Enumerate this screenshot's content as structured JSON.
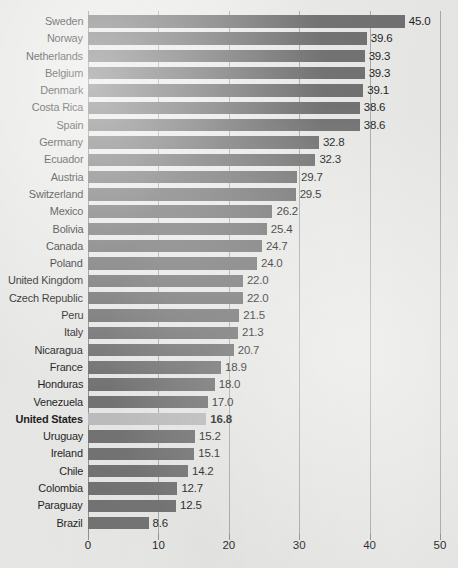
{
  "chart_data": {
    "type": "bar",
    "orientation": "horizontal",
    "title": "",
    "subtitle": "",
    "xlabel": "",
    "ylabel": "",
    "xlim": [
      0,
      50
    ],
    "xticks": [
      0,
      10,
      20,
      30,
      40,
      50
    ],
    "xtick_labels": [
      "0",
      "10",
      "20",
      "30",
      "40",
      "50"
    ],
    "grid": true,
    "grid_axis": "x",
    "legend": false,
    "value_labels": true,
    "value_label_format": "one-decimal",
    "highlight_category": "United States",
    "colors": {
      "bar": "#6f6f6f",
      "bar_highlight": "#bcbcbc",
      "background": "#e9e9e7",
      "gridline": "#a9a9a9",
      "axis": "#8e8e8e",
      "text": "#1b1b1b"
    },
    "categories": [
      "Sweden",
      "Norway",
      "Netherlands",
      "Belgium",
      "Denmark",
      "Costa Rica",
      "Spain",
      "Germany",
      "Ecuador",
      "Austria",
      "Switzerland",
      "Mexico",
      "Bolivia",
      "Canada",
      "Poland",
      "United Kingdom",
      "Czech Republic",
      "Peru",
      "Italy",
      "Nicaragua",
      "France",
      "Honduras",
      "Venezuela",
      "United States",
      "Uruguay",
      "Ireland",
      "Chile",
      "Colombia",
      "Paraguay",
      "Brazil"
    ],
    "values": [
      45.0,
      39.6,
      39.3,
      39.3,
      39.1,
      38.6,
      38.6,
      32.8,
      32.3,
      29.7,
      29.5,
      26.2,
      25.4,
      24.7,
      24.0,
      22.0,
      22.0,
      21.5,
      21.3,
      20.7,
      18.9,
      18.0,
      17.0,
      16.8,
      15.2,
      15.1,
      14.2,
      12.7,
      12.5,
      8.6
    ],
    "value_labels_text": [
      "45.0",
      "39.6",
      "39.3",
      "39.3",
      "39.1",
      "38.6",
      "38.6",
      "32.8",
      "32.3",
      "29.7",
      "29.5",
      "26.2",
      "25.4",
      "24.7",
      "24.0",
      "22.0",
      "22.0",
      "21.5",
      "21.3",
      "20.7",
      "18.9",
      "18.0",
      "17.0",
      "16.8",
      "15.2",
      "15.1",
      "14.2",
      "12.7",
      "12.5",
      "8.6"
    ]
  }
}
